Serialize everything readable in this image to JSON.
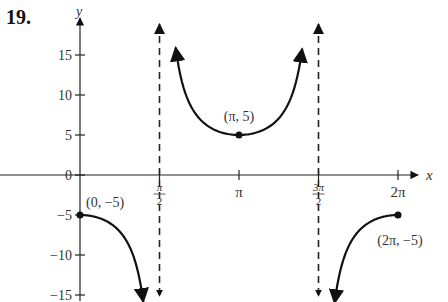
{
  "problem_number": "19.",
  "chart_data": {
    "type": "line",
    "title": "",
    "function": "y = -5 sec(x)",
    "xlabel": "x",
    "ylabel": "y",
    "xlim": [
      0,
      6.2832
    ],
    "ylim": [
      -15,
      15
    ],
    "grid": false,
    "x_ticks": [
      {
        "value": 1.5708,
        "label_num": "π",
        "label_den": "2"
      },
      {
        "value": 3.1416,
        "label": "π"
      },
      {
        "value": 4.7124,
        "label_num": "3π",
        "label_den": "2"
      },
      {
        "value": 6.2832,
        "label": "2π"
      }
    ],
    "y_ticks": [
      {
        "value": 15,
        "label": "15"
      },
      {
        "value": 10,
        "label": "10"
      },
      {
        "value": 5,
        "label": "5"
      },
      {
        "value": 0,
        "label": "0"
      },
      {
        "value": -5,
        "label": "−5"
      },
      {
        "value": -10,
        "label": "−10"
      },
      {
        "value": -15,
        "label": "−15"
      }
    ],
    "asymptotes": [
      1.5708,
      4.7124
    ],
    "branches": [
      {
        "x_start": 0,
        "x_end": 1.25,
        "end_arrow": true,
        "start_point": true
      },
      {
        "x_start": 1.89,
        "x_end": 4.39,
        "start_arrow": true,
        "end_arrow": true
      },
      {
        "x_start": 5.03,
        "x_end": 6.2832,
        "start_arrow": true,
        "end_point": true
      }
    ],
    "annotations": [
      {
        "x": 0,
        "y": -5,
        "label": "(0, −5)"
      },
      {
        "x": 3.1416,
        "y": 5,
        "label": "(π, 5)"
      },
      {
        "x": 6.2832,
        "y": -5,
        "label": "(2π, −5)"
      }
    ],
    "colors": {
      "curve": "#111111",
      "axis": "#222222",
      "text": "#333333"
    }
  }
}
